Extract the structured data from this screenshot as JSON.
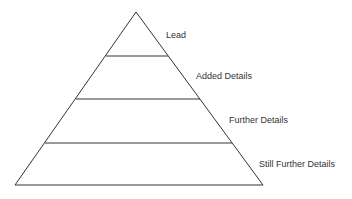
{
  "diagram": {
    "type": "pyramid",
    "line_color": "#333333",
    "levels": [
      {
        "label": "Lead"
      },
      {
        "label": "Added Details"
      },
      {
        "label": "Further Details"
      },
      {
        "label": "Still Further Details"
      }
    ]
  }
}
